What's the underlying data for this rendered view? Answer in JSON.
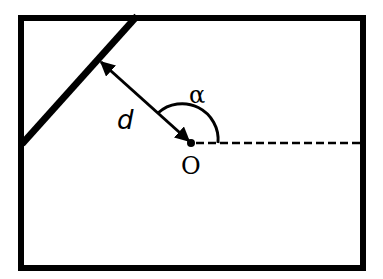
{
  "diagram": {
    "type": "geometry",
    "labels": {
      "distance": "d",
      "angle": "α",
      "origin": "O"
    },
    "colors": {
      "stroke": "#000000",
      "background": "#ffffff"
    },
    "elements": {
      "frame": {
        "x": 21,
        "y": 18,
        "width": 342,
        "height": 250,
        "stroke_width": 6
      },
      "line": {
        "x1": 22,
        "y1": 144,
        "x2": 137,
        "y2": 16,
        "stroke_width": 7
      },
      "perpendicular_arrow": {
        "x1": 101,
        "y1": 62,
        "x2": 191,
        "y2": 143,
        "double_headed": true
      },
      "origin_point": {
        "cx": 191,
        "cy": 143,
        "r": 4
      },
      "horizontal_axis": {
        "x1": 195,
        "y1": 143,
        "x2": 360,
        "y2": 143,
        "dashed": true
      },
      "angle_arc": {
        "from": "horizontal axis",
        "to": "perpendicular",
        "radius": 27
      }
    }
  }
}
